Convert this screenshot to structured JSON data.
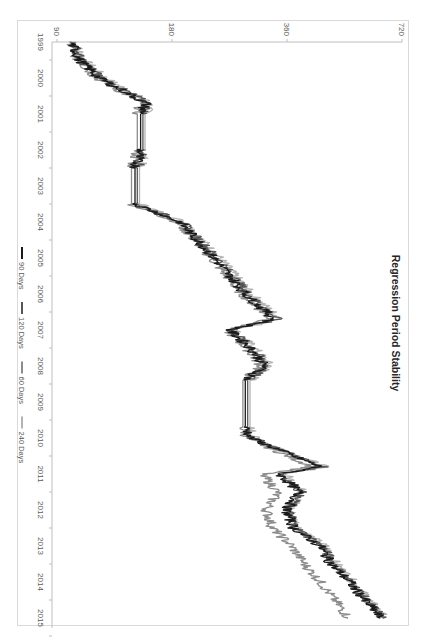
{
  "chart_data": {
    "type": "line",
    "title": "Regression Period Stability",
    "orientation_note": "figure rotated 90 degrees clockwise",
    "xlabel": "",
    "ylabel": "",
    "y_scale": "log2",
    "ylim": [
      90,
      720
    ],
    "y_ticks": [
      "90",
      "180",
      "360",
      "720"
    ],
    "x_ticks": [
      "1999",
      "2000",
      "2001",
      "2002",
      "2003",
      "2004",
      "2005",
      "2006",
      "2007",
      "2008",
      "2009",
      "2010",
      "2011",
      "2012",
      "2013",
      "2014",
      "2015"
    ],
    "grid": false,
    "legend_position": "bottom",
    "x": [
      1999.0,
      1999.5,
      2000.0,
      2000.7,
      2001.0,
      2002.0,
      2002.5,
      2003.0,
      2003.5,
      2004.0,
      2005.0,
      2006.0,
      2006.7,
      2007.0,
      2007.5,
      2008.0,
      2008.4,
      2009.0,
      2009.7,
      2010.0,
      2010.8,
      2011.0,
      2011.5,
      2012.0,
      2012.5,
      2013.0,
      2013.5,
      2014.0,
      2014.5,
      2014.8,
      2015.0
    ],
    "series": [
      {
        "name": "90 Days",
        "color": "#1a1a1a",
        "values": [
          98,
          103,
          116,
          154,
          149,
          149,
          144,
          144,
          144,
          189,
          232,
          280,
          334,
          254,
          289,
          315,
          280,
          280,
          280,
          289,
          439,
          343,
          388,
          358,
          375,
          439,
          470,
          525,
          575,
          610,
          632
        ]
      },
      {
        "name": "120 Days",
        "color": "#555555",
        "values": [
          99,
          104,
          118,
          156,
          151,
          151,
          146,
          146,
          146,
          191,
          236,
          285,
          340,
          258,
          292,
          320,
          284,
          284,
          284,
          292,
          445,
          350,
          392,
          362,
          380,
          445,
          478,
          530,
          580,
          618,
          640
        ]
      },
      {
        "name": "60 Days",
        "color": "#8c8c8c",
        "values": [
          97,
          102,
          114,
          150,
          146,
          146,
          141,
          141,
          141,
          186,
          228,
          274,
          326,
          250,
          282,
          308,
          276,
          276,
          276,
          283,
          420,
          310,
          340,
          318,
          330,
          370,
          400,
          440,
          480,
          505,
          520
        ]
      },
      {
        "name": "240 Days",
        "color": "#b3b3b3",
        "values": [
          100,
          106,
          120,
          158,
          153,
          153,
          148,
          148,
          148,
          193,
          240,
          290,
          346,
          262,
          296,
          326,
          288,
          288,
          288,
          296,
          452,
          356,
          398,
          366,
          386,
          452,
          485,
          538,
          590,
          625,
          648
        ]
      }
    ]
  },
  "legend": {
    "items": [
      {
        "label": "90 Days",
        "color": "#1a1a1a"
      },
      {
        "label": "120 Days",
        "color": "#555555"
      },
      {
        "label": "60 Days",
        "color": "#8c8c8c"
      },
      {
        "label": "240 Days",
        "color": "#b3b3b3"
      }
    ]
  }
}
